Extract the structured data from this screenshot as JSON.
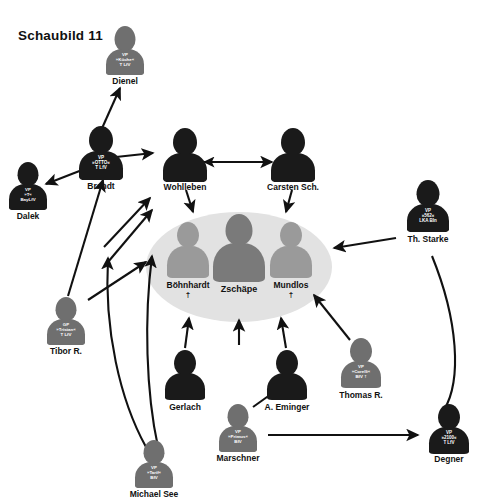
{
  "figure": {
    "title": "Schaubild 11"
  },
  "colors": {
    "dark": "#1a1a1a",
    "grey": "#6f6f6f",
    "oval": "#e2e2e2",
    "cluster_mid": "#9a9a9a",
    "cluster_dark": "#7a7a7a",
    "label": "#111111",
    "vest_text": "#ffffff"
  },
  "nodes": [
    {
      "id": "dienel",
      "name": "Dienel",
      "vest": [
        "VP",
        "»Küche«",
        "T LfV"
      ],
      "shade": "grey",
      "deceased": false
    },
    {
      "id": "brandt",
      "name": "Brandt",
      "vest": [
        "VP",
        "»OTTO«",
        "T LfV"
      ],
      "shade": "dark",
      "deceased": false
    },
    {
      "id": "dalek",
      "name": "Dalek",
      "vest": [
        "VP",
        "»T«",
        "BayLfV"
      ],
      "shade": "dark",
      "deceased": false
    },
    {
      "id": "tibor",
      "name": "Tibor R.",
      "vest": [
        "GP",
        "»Tristan«",
        "T LfV"
      ],
      "shade": "grey",
      "deceased": false
    },
    {
      "id": "wohlleben",
      "name": "Wohlleben",
      "vest": [],
      "shade": "dark",
      "deceased": false
    },
    {
      "id": "carsten",
      "name": "Carsten Sch.",
      "vest": [],
      "shade": "dark",
      "deceased": false
    },
    {
      "id": "starke",
      "name": "Th. Starke",
      "vest": [
        "VP",
        "»562«",
        "LKA Bln"
      ],
      "shade": "dark",
      "deceased": false
    },
    {
      "id": "gerlach",
      "name": "Gerlach",
      "vest": [],
      "shade": "dark",
      "deceased": false
    },
    {
      "id": "eminger",
      "name": "A. Eminger",
      "vest": [],
      "shade": "dark",
      "deceased": false
    },
    {
      "id": "thomasr",
      "name": "Thomas R.",
      "vest": [
        "VP",
        "»Corelli«",
        "BfV †"
      ],
      "shade": "grey",
      "deceased": false
    },
    {
      "id": "marschner",
      "name": "Marschner",
      "vest": [
        "VP",
        "»Primus«",
        "BfV"
      ],
      "shade": "grey",
      "deceased": false
    },
    {
      "id": "michaelsee",
      "name": "Michael See",
      "vest": [
        "VP",
        "»Tarif«",
        "BfV"
      ],
      "shade": "grey",
      "deceased": false
    },
    {
      "id": "degner",
      "name": "Degner",
      "vest": [
        "VP",
        "»2100«",
        "T LfV"
      ],
      "shade": "dark",
      "deceased": false
    }
  ],
  "cluster": {
    "members": [
      {
        "id": "boehnhardt",
        "name": "Böhnhardt",
        "deceased": true
      },
      {
        "id": "zschaepe",
        "name": "Zschäpe",
        "deceased": false
      },
      {
        "id": "mundlos",
        "name": "Mundlos",
        "deceased": true
      }
    ]
  },
  "dagger_glyph": "†",
  "edges": [
    {
      "from": "brandt",
      "to": "dienel",
      "type": "arrow"
    },
    {
      "from": "brandt",
      "to": "dalek",
      "type": "arrow"
    },
    {
      "from": "brandt",
      "to": "wohlleben",
      "type": "arrow"
    },
    {
      "from": "wohlleben",
      "to": "carsten",
      "type": "double-arrow"
    },
    {
      "from": "wohlleben",
      "to": "cluster",
      "type": "arrow"
    },
    {
      "from": "carsten",
      "to": "cluster",
      "type": "arrow"
    },
    {
      "from": "starke",
      "to": "cluster",
      "type": "arrow"
    },
    {
      "from": "tibor",
      "to": "brandt",
      "type": "arrow"
    },
    {
      "from": "michaelsee",
      "to": "brandt",
      "type": "arrow"
    },
    {
      "from": "michaelsee",
      "to": "cluster",
      "type": "arrow"
    },
    {
      "from": "gerlach",
      "to": "cluster",
      "type": "arrow"
    },
    {
      "from": "eminger",
      "to": "cluster",
      "type": "arrow"
    },
    {
      "from": "thomasr",
      "to": "cluster",
      "type": "arrow"
    },
    {
      "from": "marschner",
      "to": "eminger",
      "type": "arrow"
    },
    {
      "from": "marschner",
      "to": "degner",
      "type": "arrow"
    },
    {
      "from": "starke",
      "to": "degner",
      "type": "curve"
    }
  ]
}
